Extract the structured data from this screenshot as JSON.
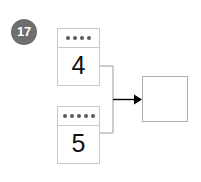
{
  "problem": {
    "number": "17"
  },
  "cards": [
    {
      "dot_count": 4,
      "value": "4"
    },
    {
      "dot_count": 5,
      "value": "5"
    }
  ],
  "answer": {
    "value": ""
  },
  "connector": {
    "arrow_icon": "arrow-right-icon",
    "stroke_color": "#9a9a9a",
    "arrow_color": "#000000"
  },
  "colors": {
    "badge_background": "#6e6e6e",
    "badge_text": "#ffffff",
    "card_border": "#c9c9c9",
    "dot": "#5a5a5a",
    "digit": "#111111",
    "answer_border": "#b0b0b0",
    "page_background": "#ffffff"
  }
}
